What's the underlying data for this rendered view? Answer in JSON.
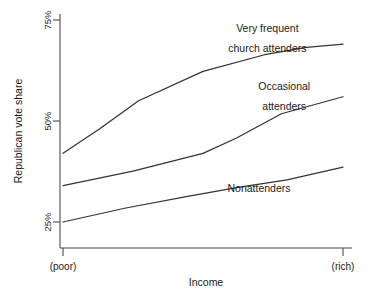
{
  "chart_data": {
    "type": "line",
    "title": "",
    "xlabel": "Income",
    "ylabel": "Republican vote share",
    "x": [
      0,
      1
    ],
    "x_tick_labels": [
      "(poor)",
      "(rich)"
    ],
    "y_tick_labels": [
      "25%",
      "50%",
      "75%"
    ],
    "y_ticks": [
      25,
      50,
      75
    ],
    "ylim": [
      18,
      76
    ],
    "xlim": [
      0,
      1
    ],
    "grid": false,
    "legend_position": "inline-annotations",
    "series": [
      {
        "name": "Very frequent church attenders",
        "label_lines": [
          "Very frequent",
          "church attenders"
        ],
        "x": [
          0.0,
          0.13,
          0.27,
          0.5,
          0.72,
          0.87,
          1.0
        ],
        "values": [
          42.0,
          48.0,
          55.0,
          62.3,
          66.4,
          68.2,
          69.0
        ]
      },
      {
        "name": "Occasional attenders",
        "label_lines": [
          "Occasional",
          "attenders"
        ],
        "x": [
          0.0,
          0.25,
          0.5,
          0.62,
          0.78,
          1.0
        ],
        "values": [
          34.0,
          37.6,
          42.0,
          45.8,
          51.8,
          56.0
        ]
      },
      {
        "name": "Nonattenders",
        "label_lines": [
          "Nonattenders"
        ],
        "x": [
          0.0,
          0.22,
          0.45,
          0.62,
          0.8,
          1.0
        ],
        "values": [
          25.0,
          28.4,
          31.4,
          33.5,
          35.4,
          38.6
        ]
      }
    ],
    "annotations": [
      {
        "text": "Very frequent",
        "x": 0.73,
        "y": 72.0
      },
      {
        "text": "church attenders",
        "x": 0.73,
        "y": 67.2
      },
      {
        "text": "Occasional",
        "x": 0.79,
        "y": 57.6
      },
      {
        "text": "attenders",
        "x": 0.79,
        "y": 52.6
      },
      {
        "text": "Nonattenders",
        "x": 0.7,
        "y": 32.4
      }
    ]
  }
}
